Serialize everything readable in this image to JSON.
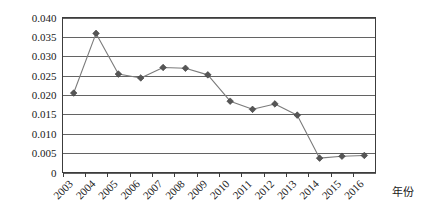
{
  "chart_data": {
    "type": "line",
    "title": "",
    "subtitle": "",
    "xlabel": "年份",
    "ylabel": "",
    "categories": [
      "2003",
      "2004",
      "2005",
      "2006",
      "2007",
      "2008",
      "2009",
      "2010",
      "2011",
      "2012",
      "2013",
      "2014",
      "2015",
      "2016"
    ],
    "values": [
      0.0205,
      0.0359,
      0.0254,
      0.0244,
      0.0271,
      0.0269,
      0.0252,
      0.0184,
      0.0163,
      0.0177,
      0.0148,
      0.0037,
      0.0042,
      0.0044
    ],
    "series": [
      {
        "name": "series-1",
        "values": [
          0.0205,
          0.0359,
          0.0254,
          0.0244,
          0.0271,
          0.0269,
          0.0252,
          0.0184,
          0.0163,
          0.0177,
          0.0148,
          0.0037,
          0.0042,
          0.0044
        ]
      }
    ],
    "ylim": [
      0,
      0.04
    ],
    "yticks": [
      0,
      0.005,
      0.01,
      0.015,
      0.02,
      0.025,
      0.03,
      0.035,
      0.04
    ],
    "ytick_labels": [
      "0",
      "0.005",
      "0.010",
      "0.015",
      "0.020",
      "0.025",
      "0.030",
      "0.035",
      "0.040"
    ],
    "grid": true,
    "grid_axis": "y",
    "legend": false,
    "legend_position": "none",
    "marker": "diamond",
    "xtick_rotation": 45,
    "colors": {
      "line": "#7b7b7b",
      "marker": "#565656",
      "grid": "#3c3c3c",
      "axis": "#3c3c3c",
      "background": "#ffffff",
      "text": "#1a1a1a"
    },
    "annotations": []
  }
}
